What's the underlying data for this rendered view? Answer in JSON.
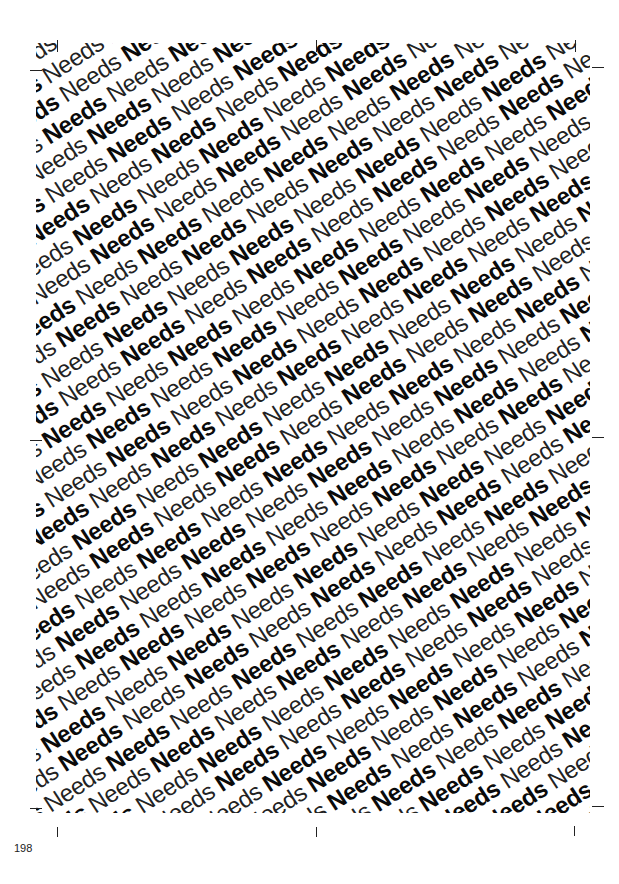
{
  "page": {
    "number": "198",
    "pattern": {
      "word": "Needs",
      "weights": [
        "light",
        "bold"
      ],
      "rotation_deg": -33,
      "rows": 60,
      "words_per_row": 26
    },
    "crop_marks": [
      "top-left",
      "top-center",
      "top-right",
      "middle-left",
      "middle-right",
      "bottom-left",
      "bottom-center",
      "bottom-right"
    ],
    "colors": {
      "text": "#111111",
      "background": "#ffffff"
    }
  }
}
